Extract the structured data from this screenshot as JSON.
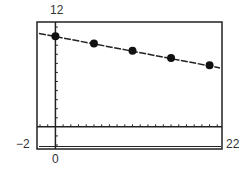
{
  "window": {
    "xmin_label": "−2",
    "xmax_label": "22",
    "ymax_label": "12",
    "origin_label": "0"
  },
  "colors": {
    "frame": "#222222",
    "points": "#111111",
    "line": "#222222",
    "background": "#ffffff"
  },
  "chart_data": {
    "type": "scatter",
    "title": "",
    "xlabel": "",
    "ylabel": "",
    "xlim": [
      -2,
      22
    ],
    "ylim": [
      -2,
      12
    ],
    "x_tick_step": 1,
    "y_tick_step": 1,
    "grid": false,
    "legend": null,
    "series": [
      {
        "name": "data points",
        "type": "scatter",
        "x": [
          0,
          5,
          10,
          15,
          20
        ],
        "y": [
          10.0,
          9.2,
          8.4,
          7.6,
          6.8
        ]
      },
      {
        "name": "regression line",
        "type": "line",
        "x": [
          -2,
          22
        ],
        "y": [
          10.3,
          6.5
        ]
      }
    ],
    "annotations": [
      "Viewing window: Xmin=-2, Xmax=22, Ymin=-2, Ymax=12"
    ]
  }
}
